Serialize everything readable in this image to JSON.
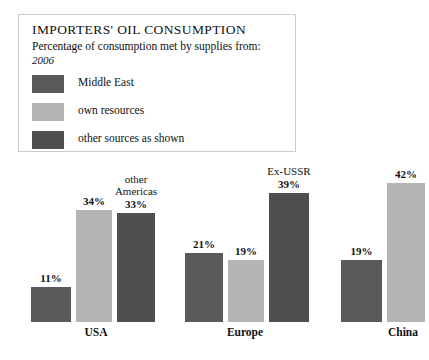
{
  "legend": {
    "title": "IMPORTERS' OIL CONSUMPTION",
    "subtitle": "Percentage of consumption met by supplies from:",
    "year": "2006",
    "items": [
      {
        "label": "Middle East",
        "color": "#5a5a5a"
      },
      {
        "label": "own resources",
        "color": "#b4b4b4"
      },
      {
        "label": "other sources as shown",
        "color": "#4e4e4e"
      }
    ]
  },
  "chart_data": {
    "type": "bar",
    "title": "IMPORTERS' OIL CONSUMPTION",
    "subtitle": "Percentage of consumption met by supplies from:",
    "year": "2006",
    "xlabel": "",
    "ylabel": "",
    "ylim": [
      0,
      45
    ],
    "grid": false,
    "legend_position": "top-left",
    "categories": [
      "USA",
      "Europe",
      "China"
    ],
    "series": [
      {
        "name": "Middle East",
        "color": "#5a5a5a",
        "values": [
          11,
          21,
          19
        ]
      },
      {
        "name": "own resources",
        "color": "#b4b4b4",
        "values": [
          34,
          19,
          42
        ]
      },
      {
        "name": "other sources as shown",
        "color": "#4e4e4e",
        "values": [
          33,
          39,
          null
        ]
      }
    ],
    "bars": [
      {
        "group": "USA",
        "series": "Middle East",
        "value": 11,
        "value_label": "11%",
        "top_label": "",
        "color": "#5a5a5a",
        "x": 31,
        "width": 40,
        "height": 35
      },
      {
        "group": "USA",
        "series": "own resources",
        "value": 34,
        "value_label": "34%",
        "top_label": "",
        "color": "#b4b4b4",
        "x": 76,
        "width": 36,
        "height": 112
      },
      {
        "group": "USA",
        "series": "other sources as shown",
        "value": 33,
        "value_label": "33%",
        "top_label": "other\nAmericas",
        "color": "#4e4e4e",
        "x": 117,
        "width": 38,
        "height": 109
      },
      {
        "group": "Europe",
        "series": "Middle East",
        "value": 21,
        "value_label": "21%",
        "top_label": "",
        "color": "#5a5a5a",
        "x": 185,
        "width": 38,
        "height": 69
      },
      {
        "group": "Europe",
        "series": "own resources",
        "value": 19,
        "value_label": "19%",
        "top_label": "",
        "color": "#b4b4b4",
        "x": 228,
        "width": 36,
        "height": 62
      },
      {
        "group": "Europe",
        "series": "other sources as shown",
        "value": 39,
        "value_label": "39%",
        "top_label": "Ex-USSR",
        "color": "#4e4e4e",
        "x": 269,
        "width": 40,
        "height": 129
      },
      {
        "group": "China",
        "series": "Middle East",
        "value": 19,
        "value_label": "19%",
        "top_label": "",
        "color": "#5a5a5a",
        "x": 341,
        "width": 41,
        "height": 62
      },
      {
        "group": "China",
        "series": "own resources",
        "value": 42,
        "value_label": "42%",
        "top_label": "",
        "color": "#b4b4b4",
        "x": 387,
        "width": 38,
        "height": 139
      }
    ],
    "group_labels": [
      {
        "text": "USA",
        "x": 76,
        "width": 40
      },
      {
        "text": "Europe",
        "x": 222,
        "width": 46
      },
      {
        "text": "China",
        "x": 383,
        "width": 40
      }
    ],
    "annotations": [
      "other Americas",
      "Ex-USSR"
    ]
  }
}
